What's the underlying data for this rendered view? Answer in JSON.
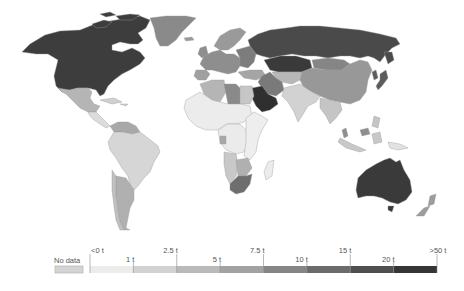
{
  "map": {
    "type": "choropleth",
    "projection": "robinson-like world",
    "color_scheme": "grayscale sequential"
  },
  "legend": {
    "no_data": {
      "label": "No data",
      "color": "#d4d4d4"
    },
    "bins": [
      {
        "from": "<0 t",
        "to": "1 t",
        "color": "#ececec"
      },
      {
        "from": "1 t",
        "to": "2.5 t",
        "color": "#d2d2d2"
      },
      {
        "from": "2.5 t",
        "to": "5 t",
        "color": "#bababa"
      },
      {
        "from": "5 t",
        "to": "7.5 t",
        "color": "#a2a2a2"
      },
      {
        "from": "7.5 t",
        "to": "10 t",
        "color": "#858585"
      },
      {
        "from": "10 t",
        "to": "15 t",
        "color": "#6b6b6b"
      },
      {
        "from": "15 t",
        "to": "20 t",
        "color": "#4f4f4f"
      },
      {
        "from": "20 t",
        "to": ">50 t",
        "color": "#353535"
      }
    ],
    "tick_labels_upper": [
      "<0 t",
      "2.5 t",
      "7.5 t",
      "15 t",
      ">50 t"
    ],
    "tick_labels_lower": [
      "1 t",
      "5 t",
      "10 t",
      "20 t"
    ]
  },
  "regions": {
    "north_america": "#3d3d3d",
    "greenland": "#8a8a8a",
    "mexico": "#b5b5b5",
    "central_america": "#dcdcdc",
    "caribbean": "#d0d0d0",
    "venezuela": "#a8a8a8",
    "brazil_andes": "#d6d6d6",
    "argentina": "#b0b0b0",
    "chile": "#c0c0c0",
    "europe_west": "#8e8e8e",
    "europe_north": "#9a9a9a",
    "europe_east": "#7c7c7c",
    "iberia": "#a0a0a0",
    "russia": "#4a4a4a",
    "kazakhstan": "#3a3a3a",
    "central_asia": "#b8b8b8",
    "mongolia": "#858585",
    "china": "#989898",
    "korea_japan": "#5c5c5c",
    "middle_east_iran": "#7a7a7a",
    "saudi_gulf": "#2f2f2f",
    "turkey_caucasus": "#a5a5a5",
    "india_region": "#d2d2d2",
    "southeast_asia": "#c5c5c5",
    "malaysia": "#8f8f8f",
    "indonesia": "#c8c8c8",
    "png": "#e2e2e2",
    "north_africa_algeria": "#b5b5b5",
    "libya": "#8a8a8a",
    "egypt": "#c6c6c6",
    "sahel_west": "#ececec",
    "central_africa": "#ebebeb",
    "gabon": "#a8a8a8",
    "east_africa": "#eeeeee",
    "angola_namibia": "#c8c8c8",
    "botswana": "#b0b0b0",
    "south_africa": "#6e6e6e",
    "madagascar": "#ececec",
    "australia": "#3a3a3a",
    "new_zealand": "#9c9c9c"
  }
}
